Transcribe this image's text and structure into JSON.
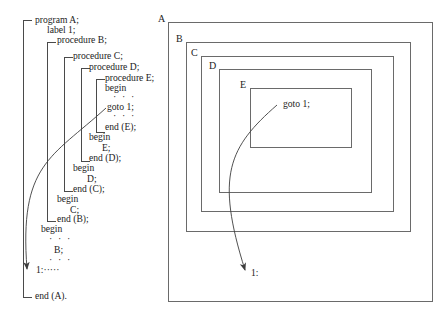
{
  "figure": {
    "type": "diagram"
  },
  "left_panel": {
    "name": "program-listing",
    "lines": [
      {
        "id": "l01",
        "text": "program A;",
        "x": 35,
        "y": 15,
        "indent": 0
      },
      {
        "id": "l02",
        "text": "label 1;",
        "x": 47,
        "y": 25,
        "indent": 1
      },
      {
        "id": "l03",
        "text": "procedure B;",
        "x": 57,
        "y": 35,
        "indent": 1
      },
      {
        "id": "l04",
        "text": "procedure C;",
        "x": 73,
        "y": 51,
        "indent": 2
      },
      {
        "id": "l05",
        "text": "procedure D;",
        "x": 89,
        "y": 62,
        "indent": 3
      },
      {
        "id": "l06",
        "text": "procedure E;",
        "x": 105,
        "y": 73,
        "indent": 4
      },
      {
        "id": "l07",
        "text": "begin",
        "x": 105,
        "y": 83,
        "indent": 4
      },
      {
        "id": "l08",
        "text": "· · ·",
        "x": 113,
        "y": 92,
        "indent": 5
      },
      {
        "id": "l09",
        "text": "goto 1;",
        "x": 107,
        "y": 102,
        "indent": 5
      },
      {
        "id": "l10",
        "text": "· · ·",
        "x": 113,
        "y": 111,
        "indent": 5
      },
      {
        "id": "l11",
        "text": "end (E);",
        "x": 105,
        "y": 122,
        "indent": 4
      },
      {
        "id": "l12",
        "text": "begin",
        "x": 89,
        "y": 132,
        "indent": 3
      },
      {
        "id": "l13",
        "text": "E;",
        "x": 102,
        "y": 143,
        "indent": 4
      },
      {
        "id": "l14",
        "text": "end (D);",
        "x": 89,
        "y": 153,
        "indent": 3
      },
      {
        "id": "l15",
        "text": "begin",
        "x": 73,
        "y": 163,
        "indent": 2
      },
      {
        "id": "l16",
        "text": "D;",
        "x": 87,
        "y": 174,
        "indent": 3
      },
      {
        "id": "l17",
        "text": "end (C);",
        "x": 73,
        "y": 184,
        "indent": 2
      },
      {
        "id": "l18",
        "text": "begin",
        "x": 57,
        "y": 194,
        "indent": 1
      },
      {
        "id": "l19",
        "text": "C;",
        "x": 70,
        "y": 205,
        "indent": 2
      },
      {
        "id": "l20",
        "text": "end (B);",
        "x": 57,
        "y": 214,
        "indent": 1
      },
      {
        "id": "l21",
        "text": "begin",
        "x": 41,
        "y": 224,
        "indent": 0
      },
      {
        "id": "l22",
        "text": "· · ·",
        "x": 49,
        "y": 234,
        "indent": 1
      },
      {
        "id": "l23",
        "text": "B;",
        "x": 54,
        "y": 245,
        "indent": 1
      },
      {
        "id": "l24",
        "text": "· · ·",
        "x": 49,
        "y": 255,
        "indent": 1
      },
      {
        "id": "l25",
        "text": "1:·····",
        "x": 36,
        "y": 265,
        "indent": 0
      },
      {
        "id": "l26",
        "text": "end (A).",
        "x": 35,
        "y": 291,
        "indent": 0
      }
    ],
    "brackets": [
      {
        "id": "bracket-A",
        "scope": "A",
        "x": 23,
        "y": 20,
        "height": 278
      },
      {
        "id": "bracket-B",
        "scope": "B",
        "x": 47,
        "y": 42,
        "height": 180
      },
      {
        "id": "bracket-C",
        "scope": "C",
        "x": 64,
        "y": 57,
        "height": 135
      },
      {
        "id": "bracket-D",
        "scope": "D",
        "x": 81,
        "y": 68,
        "height": 94
      },
      {
        "id": "bracket-E",
        "scope": "E",
        "x": 96,
        "y": 79,
        "height": 54
      }
    ],
    "goto_arrow": {
      "label": "goto-jump-arrow",
      "from": {
        "x": 106,
        "y": 108
      },
      "to": {
        "x": 27,
        "y": 269
      }
    }
  },
  "right_panel": {
    "name": "scope-nesting-diagram",
    "boxes": [
      {
        "id": "box-A",
        "label": "A",
        "x": 168,
        "y": 22,
        "w": 265,
        "h": 280,
        "label_x": 158,
        "label_y": 13
      },
      {
        "id": "box-B",
        "label": "B",
        "x": 186,
        "y": 42,
        "w": 225,
        "h": 190,
        "label_x": 176,
        "label_y": 33
      },
      {
        "id": "box-C",
        "label": "C",
        "x": 201,
        "y": 56,
        "w": 193,
        "h": 156,
        "label_x": 191,
        "label_y": 47
      },
      {
        "id": "box-D",
        "label": "D",
        "x": 219,
        "y": 69,
        "w": 153,
        "h": 124,
        "label_x": 209,
        "label_y": 60
      },
      {
        "id": "box-E",
        "label": "E",
        "x": 250,
        "y": 88,
        "w": 102,
        "h": 60,
        "label_x": 240,
        "label_y": 79
      }
    ],
    "goto_text": "goto 1;",
    "goto_text_pos": {
      "x": 283,
      "y": 98
    },
    "label_text": "1:",
    "label_text_pos": {
      "x": 251,
      "y": 267
    },
    "goto_arrow": {
      "label": "goto-jump-arrow",
      "from": {
        "x": 277,
        "y": 105
      },
      "to": {
        "x": 245,
        "y": 270
      }
    }
  },
  "colors": {
    "line": "#6a6a6a",
    "bracket": "#4a4a4a",
    "text": "#1c1c1c",
    "background": "#ffffff"
  }
}
